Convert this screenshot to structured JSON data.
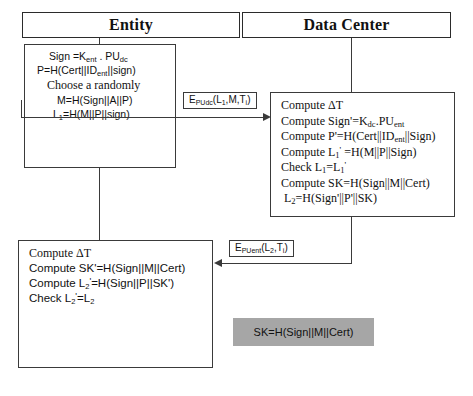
{
  "diagram": {
    "lanes": [
      {
        "name": "entity",
        "label": "Entity"
      },
      {
        "name": "data-center",
        "label": "Data Center"
      }
    ],
    "colors": {
      "stroke": "#3a3a3a",
      "background": "#ffffff",
      "highlight_fill": "#a6a6a6",
      "text": "#111111"
    }
  },
  "entity_step1": {
    "lines": [
      "Sign =K",
      "P=H(Cert||ID",
      "Choose a randomly",
      "M=H(Sign||A||P)",
      "L"
    ],
    "line1": {
      "pre": "Sign =K",
      "sub1": "ent",
      "mid": " . PU",
      "sub2": "dc"
    },
    "line2": {
      "pre": "P=H(Cert||ID",
      "sub1": "ent",
      "post": "||sign)"
    },
    "line3": "Choose a randomly",
    "line4": "M=H(Sign||A||P)",
    "line5": {
      "pre": "L",
      "sub1": "1",
      "post": "=H(M||P||sign)"
    }
  },
  "message1": {
    "pre": "E",
    "sub1": "PUdc",
    "post": "(L",
    "sub2": "1",
    "post2": ",M,T",
    "sub3": "i",
    "post3": ")",
    "direction": "entity-to-data-center"
  },
  "data_center_step": {
    "line1": "Compute ΔT",
    "line2": {
      "pre": "Compute Sign'=K",
      "sub1": "dc",
      "mid": ".PU",
      "sub2": "ent"
    },
    "line3": {
      "pre": "Compute P'=H(Cert||ID",
      "sub1": "ent",
      "post": "||Sign)"
    },
    "line4": {
      "pre": "Compute L",
      "sub1": "1",
      "sup": "'",
      "post": " =H(M||P||Sign)"
    },
    "line5": {
      "pre": "Check L",
      "sub1": "1",
      "mid": "=L",
      "sub2": "1",
      "sup": "'"
    },
    "line6": "Compute SK=H(Sign||M||Cert)",
    "line7": {
      "pre": "L",
      "sub1": "2",
      "post": "=H(Sign'||P'||SK)"
    }
  },
  "message2": {
    "pre": "E",
    "sub1": "PUent",
    "post": "(L",
    "sub2": "2",
    "post2": ",T",
    "sub3": "i",
    "post3": ")",
    "direction": "data-center-to-entity"
  },
  "entity_step2": {
    "line1": "Compute ΔT",
    "line2": "Compute SK'=H(Sign||M||Cert)",
    "line3": {
      "pre": "Compute L",
      "sub1": "2",
      "sup": "'",
      "post": "=H(Sign||P||SK')"
    },
    "line4": {
      "pre": "Check L",
      "sub1": "2",
      "sup": "'",
      "mid": "=L",
      "sub2": "2"
    }
  },
  "session_key": {
    "label": "SK=H(Sign||M||Cert)"
  }
}
